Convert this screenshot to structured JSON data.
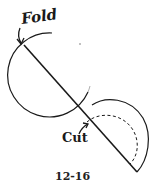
{
  "figure": {
    "number": "12-16",
    "labels": {
      "fold": "Fold",
      "cut": "Cut"
    },
    "colors": {
      "ink": "#1a1a1a",
      "background": "#ffffff"
    }
  }
}
